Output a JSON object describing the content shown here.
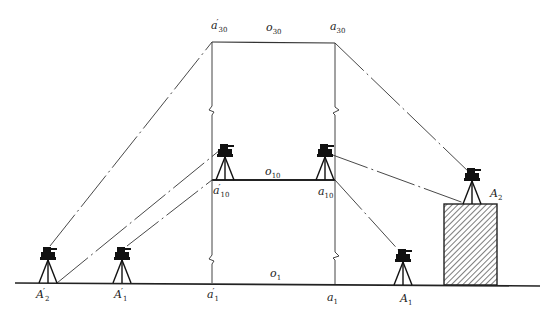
{
  "figure": {
    "colors": {
      "line": "#333333",
      "instrument": "#111111",
      "hatch": "#444444",
      "background": "#ffffff"
    }
  },
  "labels": {
    "a30_prime": {
      "base": "a",
      "prime": "′",
      "sub": "30"
    },
    "o30": {
      "base": "o",
      "sub": "30"
    },
    "a30": {
      "base": "a",
      "sub": "30"
    },
    "o10": {
      "base": "o",
      "sub": "10"
    },
    "a10_prime": {
      "base": "a",
      "prime": "′",
      "sub": "10"
    },
    "a10": {
      "base": "a",
      "sub": "10"
    },
    "o1": {
      "base": "o",
      "sub": "1"
    },
    "a1_prime": {
      "base": "a",
      "prime": "′",
      "sub": "1"
    },
    "a1": {
      "base": "a",
      "sub": "1"
    },
    "A2_prime": {
      "base": "A",
      "prime": "′",
      "sub": "2"
    },
    "A1_prime": {
      "base": "A",
      "prime": "′",
      "sub": "1"
    },
    "A1": {
      "base": "A",
      "sub": "1"
    },
    "A2": {
      "base": "A",
      "sub": "2"
    }
  },
  "instruments": [
    {
      "name": "A2-prime",
      "x": 48,
      "ground_y": 283
    },
    {
      "name": "A1-prime",
      "x": 122,
      "ground_y": 283
    },
    {
      "name": "a10-prime-station",
      "x": 225,
      "ground_y": 180
    },
    {
      "name": "a10-station",
      "x": 325,
      "ground_y": 180
    },
    {
      "name": "A1",
      "x": 403,
      "ground_y": 285
    },
    {
      "name": "A2",
      "x": 472,
      "ground_y": 204
    }
  ]
}
